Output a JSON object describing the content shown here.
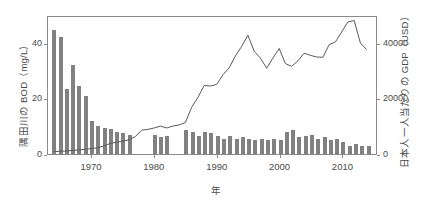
{
  "chart_data": {
    "type": "bar",
    "title": "",
    "subtitle": "",
    "xlabel": "年",
    "ylabel": "隅田川の BOD（mg/L）",
    "ylabel_right": "日本人一人当たりの GDP（USD）",
    "grid": false,
    "legend": "none",
    "xlim": [
      1963.0,
      2015.5
    ],
    "ylim": [
      0,
      50
    ],
    "ylim_right": [
      0,
      50000
    ],
    "xticks": [
      1970,
      1980,
      1990,
      2000,
      2010
    ],
    "xtick_labels": [
      "1970",
      "1980",
      "1990",
      "2000",
      "2010"
    ],
    "yticks_left": [
      0,
      20,
      40
    ],
    "ytick_labels_left": [
      "0",
      "20",
      "40"
    ],
    "yticks_right": [
      0,
      20000,
      40000
    ],
    "ytick_labels_right": [
      "0",
      "20000",
      "40000"
    ],
    "bar_color": "#818181",
    "line_color": "#5a5a5a",
    "x": [
      1964,
      1965,
      1966,
      1967,
      1968,
      1969,
      1970,
      1971,
      1972,
      1973,
      1974,
      1975,
      1976,
      1977,
      1978,
      1979,
      1980,
      1981,
      1982,
      1983,
      1984,
      1985,
      1986,
      1987,
      1988,
      1989,
      1990,
      1991,
      1992,
      1993,
      1994,
      1995,
      1996,
      1997,
      1998,
      1999,
      2000,
      2001,
      2002,
      2003,
      2004,
      2005,
      2006,
      2007,
      2008,
      2009,
      2010,
      2011,
      2012,
      2013,
      2014
    ],
    "series": [
      {
        "name": "隅田川の BOD（mg/L）",
        "kind": "bar",
        "axis": "left",
        "unit": "mg/L",
        "values": [
          44.5,
          42.0,
          23.5,
          32.0,
          24.5,
          21.0,
          12.0,
          10.0,
          9.5,
          9.0,
          8.0,
          7.5,
          7.0,
          0.0,
          0.0,
          0.0,
          7.0,
          6.0,
          6.5,
          0.0,
          0.0,
          8.5,
          8.0,
          6.5,
          8.0,
          7.5,
          6.5,
          5.5,
          6.5,
          5.5,
          6.0,
          5.5,
          5.0,
          5.5,
          5.0,
          5.5,
          5.0,
          8.0,
          8.5,
          6.0,
          6.5,
          7.0,
          5.5,
          6.0,
          5.0,
          5.5,
          4.5,
          3.0,
          3.5,
          3.0,
          3.0
        ]
      },
      {
        "name": "日本人一人当たりの GDP（USD）",
        "kind": "line",
        "axis": "right",
        "unit": "USD",
        "values": [
          900,
          1000,
          1100,
          1300,
          1500,
          1700,
          2000,
          2300,
          3000,
          3900,
          4300,
          4700,
          5200,
          6400,
          8700,
          9000,
          9500,
          10200,
          9500,
          10200,
          10600,
          11500,
          17100,
          20700,
          25000,
          24800,
          25400,
          28900,
          31500,
          35800,
          39300,
          43400,
          37500,
          35000,
          31300,
          35000,
          38500,
          33000,
          32000,
          34000,
          36800,
          36000,
          35400,
          35300,
          39900,
          40900,
          44500,
          48200,
          48700,
          40500,
          38100
        ]
      }
    ]
  }
}
